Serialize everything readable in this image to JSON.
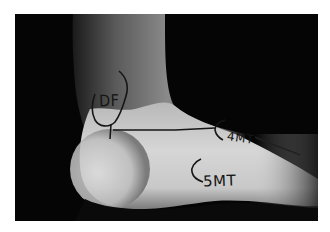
{
  "photo": {
    "description": "Grayscale photograph of the lateral side of a foot with marker annotations",
    "annotations": [
      {
        "id": "df",
        "text": "DF"
      },
      {
        "id": "4mt",
        "text": "4MT"
      },
      {
        "id": "5mt",
        "text": "5MT"
      }
    ],
    "colors": {
      "background": "#050505",
      "skin_light": "#d8d8d8",
      "skin_mid": "#9a9a9a",
      "ink": "#161616",
      "page": "#ffffff"
    }
  }
}
